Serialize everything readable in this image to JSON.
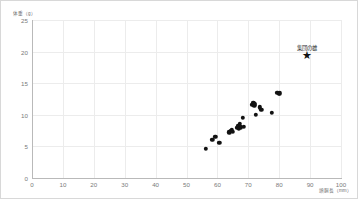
{
  "chart_data": {
    "type": "scatter",
    "title": "",
    "xlabel": "頭胴長（mm）",
    "ylabel": "体重（g）",
    "xlim": [
      0,
      100
    ],
    "ylim": [
      0,
      25
    ],
    "xticks": [
      0,
      10,
      20,
      30,
      40,
      50,
      60,
      70,
      80,
      90,
      100
    ],
    "yticks": [
      0,
      5,
      10,
      15,
      20,
      25
    ],
    "grid": true,
    "legend_position": "inside-top-right",
    "series": [
      {
        "name": "個体",
        "marker": "circle",
        "color": "#121212",
        "points": [
          [
            56.2,
            4.6
          ],
          [
            58.4,
            6.0
          ],
          [
            59.3,
            6.5
          ],
          [
            60.6,
            5.6
          ],
          [
            63.9,
            7.2
          ],
          [
            64.3,
            7.5
          ],
          [
            64.6,
            7.6
          ],
          [
            65.0,
            7.3
          ],
          [
            66.5,
            7.9
          ],
          [
            66.8,
            8.2
          ],
          [
            67.0,
            7.8
          ],
          [
            67.3,
            8.6
          ],
          [
            67.5,
            8.0
          ],
          [
            68.3,
            9.5
          ],
          [
            68.6,
            8.1
          ],
          [
            71.3,
            11.6
          ],
          [
            71.6,
            11.8
          ],
          [
            71.9,
            11.5
          ],
          [
            72.2,
            11.7
          ],
          [
            72.5,
            10.0
          ],
          [
            73.8,
            11.2
          ],
          [
            74.2,
            10.8
          ],
          [
            77.6,
            10.3
          ],
          [
            79.4,
            13.5
          ],
          [
            79.8,
            13.3
          ],
          [
            80.1,
            13.4
          ]
        ]
      },
      {
        "name": "集団の雄",
        "marker": "star",
        "color": "#121212",
        "points": [
          [
            89.0,
            19.4
          ]
        ]
      }
    ],
    "annotations": [
      {
        "text": "集団の雄",
        "x": 89.0,
        "y": 21.2
      }
    ]
  }
}
